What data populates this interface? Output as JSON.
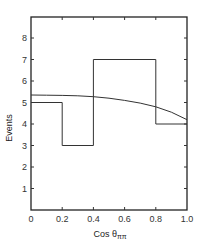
{
  "chart_data": {
    "type": "bar",
    "subtype": "histogram-with-curve",
    "title": "",
    "xlabel": "Cos θ",
    "xlabel_subscript": "ππ",
    "ylabel": "Events",
    "xlim": [
      0,
      1.0
    ],
    "ylim": [
      0,
      9
    ],
    "grid": false,
    "legend": null,
    "x_ticks": [
      "0",
      "0.2",
      "0.4",
      "0.6",
      "0.8",
      "1.0"
    ],
    "y_ticks": [
      "1",
      "2",
      "3",
      "4",
      "5",
      "6",
      "7",
      "8"
    ],
    "bins": [
      {
        "from": 0.0,
        "to": 0.2,
        "value": 5
      },
      {
        "from": 0.2,
        "to": 0.4,
        "value": 3
      },
      {
        "from": 0.4,
        "to": 0.8,
        "value": 7
      },
      {
        "from": 0.8,
        "to": 1.0,
        "value": 4
      }
    ],
    "series": [
      {
        "name": "histogram",
        "type": "step",
        "categories": [
          "0-0.2",
          "0.2-0.4",
          "0.4-0.8",
          "0.8-1.0"
        ],
        "values": [
          5,
          3,
          7,
          4
        ]
      },
      {
        "name": "fit curve",
        "type": "line",
        "x": [
          0.0,
          0.1,
          0.2,
          0.3,
          0.4,
          0.5,
          0.6,
          0.7,
          0.8,
          0.9,
          1.0
        ],
        "values": [
          5.35,
          5.34,
          5.33,
          5.31,
          5.27,
          5.2,
          5.1,
          4.97,
          4.8,
          4.55,
          4.2
        ]
      }
    ]
  }
}
